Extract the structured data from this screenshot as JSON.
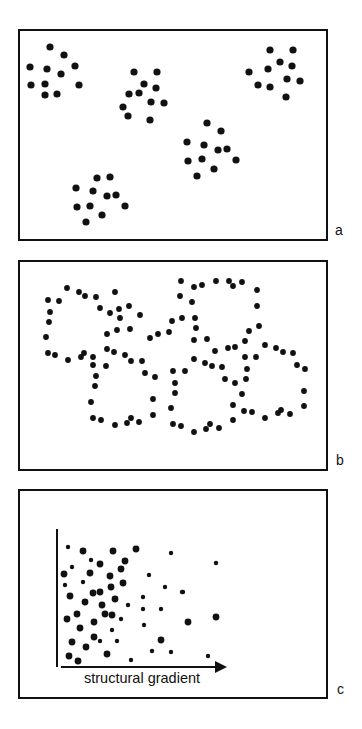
{
  "figure": {
    "panels": [
      {
        "id": "a",
        "label": "a",
        "description": "Clumped distribution: five discrete clusters of points",
        "box": {
          "x": 19,
          "y": 30,
          "w": 308,
          "h": 210
        },
        "dot_radius": 3.6,
        "dots": [
          [
            50,
            47
          ],
          [
            64,
            55
          ],
          [
            30,
            67
          ],
          [
            47,
            69
          ],
          [
            61,
            74
          ],
          [
            75,
            66
          ],
          [
            31,
            85
          ],
          [
            45,
            84
          ],
          [
            79,
            85
          ],
          [
            45,
            95
          ],
          [
            57,
            94
          ],
          [
            134,
            72
          ],
          [
            157,
            72
          ],
          [
            144,
            84
          ],
          [
            156,
            88
          ],
          [
            129,
            94
          ],
          [
            139,
            93
          ],
          [
            151,
            102
          ],
          [
            164,
            103
          ],
          [
            123,
            107
          ],
          [
            128,
            116
          ],
          [
            150,
            120
          ],
          [
            270,
            50
          ],
          [
            293,
            50
          ],
          [
            280,
            62
          ],
          [
            292,
            66
          ],
          [
            249,
            72
          ],
          [
            268,
            69
          ],
          [
            287,
            79
          ],
          [
            300,
            81
          ],
          [
            258,
            85
          ],
          [
            270,
            87
          ],
          [
            286,
            97
          ],
          [
            207,
            123
          ],
          [
            221,
            131
          ],
          [
            187,
            142
          ],
          [
            204,
            145
          ],
          [
            218,
            150
          ],
          [
            227,
            149
          ],
          [
            188,
            161
          ],
          [
            202,
            159
          ],
          [
            236,
            160
          ],
          [
            214,
            169
          ],
          [
            197,
            176
          ],
          [
            97,
            178
          ],
          [
            110,
            177
          ],
          [
            76,
            188
          ],
          [
            93,
            191
          ],
          [
            107,
            196
          ],
          [
            116,
            195
          ],
          [
            77,
            207
          ],
          [
            90,
            206
          ],
          [
            125,
            206
          ],
          [
            102,
            215
          ],
          [
            86,
            222
          ]
        ]
      },
      {
        "id": "b",
        "label": "b",
        "description": "Points arranged along ring-like boundaries (cellular / reticulate pattern)",
        "box": {
          "x": 19,
          "y": 261,
          "w": 308,
          "h": 209
        },
        "dot_radius": 2.9,
        "dots": [
          [
            67,
            288
          ],
          [
            79,
            292
          ],
          [
            85,
            296
          ],
          [
            96,
            297
          ],
          [
            48,
            300
          ],
          [
            59,
            301
          ],
          [
            50,
            312
          ],
          [
            49,
            322
          ],
          [
            46,
            337
          ],
          [
            115,
            292
          ],
          [
            100,
            308
          ],
          [
            110,
            313
          ],
          [
            119,
            309
          ],
          [
            120,
            318
          ],
          [
            129,
            306
          ],
          [
            140,
            315
          ],
          [
            181,
            281
          ],
          [
            194,
            287
          ],
          [
            202,
            285
          ],
          [
            216,
            281
          ],
          [
            229,
            281
          ],
          [
            233,
            286
          ],
          [
            242,
            282
          ],
          [
            257,
            290
          ],
          [
            180,
            296
          ],
          [
            192,
            302
          ],
          [
            257,
            306
          ],
          [
            107,
            334
          ],
          [
            117,
            330
          ],
          [
            130,
            329
          ],
          [
            150,
            338
          ],
          [
            158,
            334
          ],
          [
            169,
            332
          ],
          [
            172,
            321
          ],
          [
            182,
            318
          ],
          [
            195,
            318
          ],
          [
            196,
            328
          ],
          [
            194,
            340
          ],
          [
            207,
            339
          ],
          [
            249,
            331
          ],
          [
            259,
            326
          ],
          [
            265,
            345
          ],
          [
            215,
            351
          ],
          [
            228,
            348
          ],
          [
            235,
            347
          ],
          [
            245,
            341
          ],
          [
            276,
            348
          ],
          [
            283,
            352
          ],
          [
            293,
            353
          ],
          [
            297,
            365
          ],
          [
            305,
            369
          ],
          [
            304,
            391
          ],
          [
            304,
            406
          ],
          [
            48,
            353
          ],
          [
            55,
            355
          ],
          [
            68,
            360
          ],
          [
            81,
            357
          ],
          [
            84,
            353
          ],
          [
            93,
            357
          ],
          [
            93,
            365
          ],
          [
            106,
            366
          ],
          [
            107,
            349
          ],
          [
            114,
            352
          ],
          [
            125,
            355
          ],
          [
            131,
            361
          ],
          [
            142,
            361
          ],
          [
            145,
            373
          ],
          [
            155,
            377
          ],
          [
            96,
            376
          ],
          [
            95,
            386
          ],
          [
            91,
            402
          ],
          [
            153,
            399
          ],
          [
            153,
            415
          ],
          [
            93,
            418
          ],
          [
            101,
            420
          ],
          [
            115,
            425
          ],
          [
            127,
            423
          ],
          [
            131,
            418
          ],
          [
            139,
            422
          ],
          [
            173,
            371
          ],
          [
            185,
            371
          ],
          [
            175,
            383
          ],
          [
            175,
            393
          ],
          [
            171,
            408
          ],
          [
            173,
            424
          ],
          [
            181,
            426
          ],
          [
            194,
            432
          ],
          [
            206,
            429
          ],
          [
            210,
            424
          ],
          [
            219,
            428
          ],
          [
            194,
            359
          ],
          [
            205,
            363
          ],
          [
            212,
            366
          ],
          [
            222,
            367
          ],
          [
            245,
            357
          ],
          [
            256,
            357
          ],
          [
            247,
            369
          ],
          [
            246,
            379
          ],
          [
            225,
            379
          ],
          [
            235,
            383
          ],
          [
            242,
            394
          ],
          [
            233,
            405
          ],
          [
            233,
            420
          ],
          [
            244,
            411
          ],
          [
            252,
            412
          ],
          [
            265,
            418
          ],
          [
            278,
            413
          ],
          [
            281,
            410
          ],
          [
            290,
            414
          ]
        ]
      },
      {
        "id": "c",
        "label": "c",
        "description": "Density of points decreasing along a structural gradient",
        "box": {
          "x": 19,
          "y": 490,
          "w": 308,
          "h": 208
        },
        "x_axis_label": "structural gradient",
        "axes": {
          "y_axis": {
            "x": 57,
            "y1": 529,
            "y2": 667
          },
          "x_axis": {
            "y": 667,
            "x1": 57,
            "x2": 227
          }
        },
        "dot_radius_large": 3.4,
        "dot_radius_small": 2.2,
        "dots_large": [
          [
            83,
            551
          ],
          [
            113,
            551
          ],
          [
            136,
            549
          ],
          [
            100,
            564
          ],
          [
            125,
            561
          ],
          [
            64,
            574
          ],
          [
            90,
            573
          ],
          [
            110,
            576
          ],
          [
            121,
            569
          ],
          [
            111,
            587
          ],
          [
            123,
            583
          ],
          [
            70,
            596
          ],
          [
            93,
            593
          ],
          [
            100,
            592
          ],
          [
            115,
            599
          ],
          [
            85,
            602
          ],
          [
            102,
            605
          ],
          [
            67,
            619
          ],
          [
            77,
            614
          ],
          [
            105,
            614
          ],
          [
            112,
            615
          ],
          [
            94,
            622
          ],
          [
            80,
            628
          ],
          [
            94,
            637
          ],
          [
            161,
            640
          ],
          [
            72,
            642
          ],
          [
            86,
            647
          ],
          [
            69,
            656
          ],
          [
            78,
            661
          ],
          [
            107,
            654
          ],
          [
            188,
            622
          ],
          [
            216,
            617
          ]
        ],
        "dots_small": [
          [
            68,
            547
          ],
          [
            171,
            553
          ],
          [
            91,
            560
          ],
          [
            72,
            567
          ],
          [
            149,
            575
          ],
          [
            65,
            585
          ],
          [
            83,
            582
          ],
          [
            165,
            587
          ],
          [
            182,
            592
          ],
          [
            143,
            597
          ],
          [
            128,
            605
          ],
          [
            143,
            609
          ],
          [
            161,
            609
          ],
          [
            121,
            619
          ],
          [
            144,
            625
          ],
          [
            112,
            630
          ],
          [
            100,
            641
          ],
          [
            117,
            641
          ],
          [
            131,
            660
          ],
          [
            152,
            651
          ],
          [
            171,
            652
          ],
          [
            216,
            563
          ],
          [
            183,
            592
          ],
          [
            208,
            656
          ]
        ]
      }
    ]
  },
  "colors": {
    "ink": "#111111",
    "background": "#ffffff"
  }
}
